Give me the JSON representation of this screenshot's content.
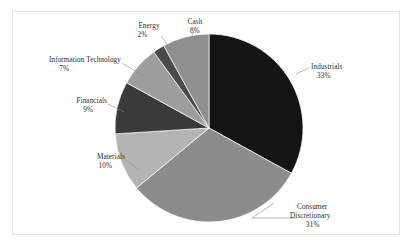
{
  "chart_data": {
    "type": "pie",
    "title": "",
    "subtitle": "",
    "xlabel": "",
    "ylabel": "",
    "legend_position": "none",
    "grid": false,
    "units": "percent",
    "total": 100,
    "start_angle_deg": 0,
    "direction": "clockwise",
    "categories": [
      "Industrials",
      "Consumer Discretionary",
      "Materials",
      "Financials",
      "Information Technology",
      "Energy",
      "Cash"
    ],
    "values": [
      33,
      31,
      10,
      9,
      7,
      2,
      8
    ],
    "slices": [
      {
        "label": "Industrials",
        "label_line1": "Industrials",
        "label_line2": "33%",
        "value": 33,
        "value_text": "33%",
        "color": "#141414"
      },
      {
        "label": "Consumer Discretionary",
        "label_line1": "Consumer",
        "label_line2": "Discretionary",
        "label_line3": "31%",
        "value": 31,
        "value_text": "31%",
        "color": "#8c8c8c"
      },
      {
        "label": "Materials",
        "label_line1": "Materials",
        "label_line2": "10%",
        "value": 10,
        "value_text": "10%",
        "color": "#b4b4b4"
      },
      {
        "label": "Financials",
        "label_line1": "Financials",
        "label_line2": "9%",
        "value": 9,
        "value_text": "9%",
        "color": "#3a3a3a"
      },
      {
        "label": "Information Technology",
        "label_line1": "Information Technology",
        "label_line2": "7%",
        "value": 7,
        "value_text": "7%",
        "color": "#9e9e9e"
      },
      {
        "label": "Energy",
        "label_line1": "Energy",
        "label_line2": "2%",
        "value": 2,
        "value_text": "2%",
        "color": "#4a4a4a"
      },
      {
        "label": "Cash",
        "label_line1": "Cash",
        "label_line2": "8%",
        "value": 8,
        "value_text": "8%",
        "color": "#8f8f8f"
      }
    ]
  },
  "figure": {
    "background_color": "#ffffff",
    "frame_color": "#e4e4e4",
    "label_color": "#2b2b2b",
    "leader_color": "#8a8a8a",
    "center_x": 209,
    "center_y": 128,
    "radius": 94
  }
}
